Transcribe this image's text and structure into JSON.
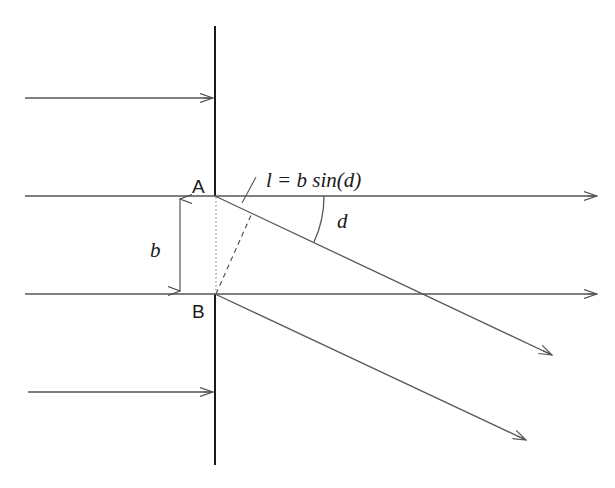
{
  "diagram": {
    "labels": {
      "point_a": "A",
      "point_b": "B",
      "separation": "b",
      "angle": "d",
      "formula": "l = b sin(d)"
    },
    "colors": {
      "wall": "#1a1a1a",
      "ray": "#555555",
      "background": "#ffffff"
    },
    "geometry": {
      "wall_x": 215,
      "wall_top": 26,
      "wall_bottom": 465,
      "ray_a_y": 196,
      "ray_b_y": 294,
      "incident_top_y": 98,
      "incident_bottom_y": 392,
      "diffracted_a_end": [
        552,
        355
      ],
      "diffracted_b_end": [
        526,
        440
      ],
      "angle_arc_radius": 109
    }
  }
}
